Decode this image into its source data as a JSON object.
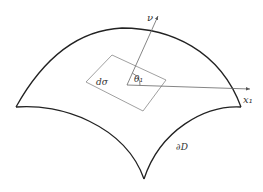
{
  "figure": {
    "labels": {
      "normal": "ν",
      "surface_element": "dσ",
      "angle": "θ₁",
      "axis": "x₁",
      "boundary": "∂D"
    },
    "colors": {
      "surface_outline": "#222222",
      "thin_lines": "#777777",
      "text": "#333333",
      "background": "#ffffff"
    }
  }
}
